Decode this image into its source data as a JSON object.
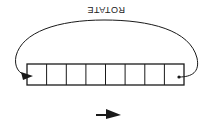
{
  "diagram": {
    "title_label": "ROTATE",
    "orientation": "upside-down (rotated 180°)",
    "register": {
      "cell_count": 8,
      "cells": [
        "",
        "",
        "",
        "",
        "",
        "",
        "",
        ""
      ]
    },
    "arrows": [
      {
        "name": "rotate-arc",
        "from": "right-end-cell",
        "to": "left-end-cell"
      },
      {
        "name": "direction-arrow",
        "direction": "right"
      }
    ],
    "colors": {
      "stroke": "#1a1a1a",
      "background": "#ffffff"
    }
  }
}
